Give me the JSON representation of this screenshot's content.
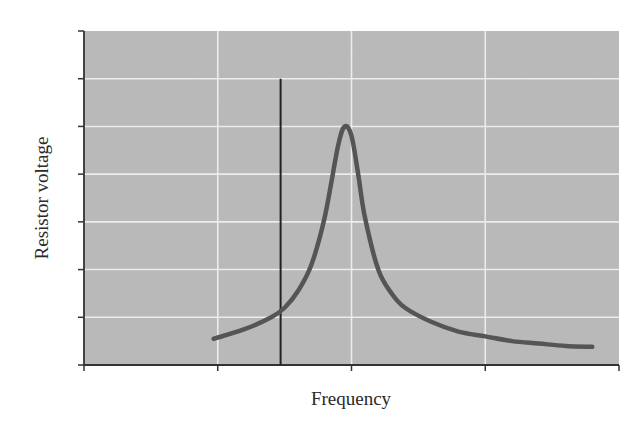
{
  "chart_data": {
    "type": "line",
    "title": "",
    "xlabel": "Frequency",
    "ylabel": "Resistor voltage",
    "x_ticks": [
      "",
      "",
      "",
      "",
      ""
    ],
    "y_ticks": [
      "",
      "",
      "",
      "",
      "",
      "",
      "",
      ""
    ],
    "grid": true,
    "legend": null,
    "xlim": [
      0,
      4
    ],
    "ylim": [
      0,
      7
    ],
    "series": [
      {
        "name": "Resistor voltage (resonance curve)",
        "x": [
          0.97,
          1.2,
          1.4,
          1.5,
          1.6,
          1.7,
          1.8,
          1.9,
          1.95,
          2.0,
          2.05,
          2.1,
          2.2,
          2.3,
          2.4,
          2.6,
          2.8,
          3.0,
          3.2,
          3.4,
          3.6,
          3.8
        ],
        "values": [
          0.55,
          0.75,
          1.0,
          1.2,
          1.55,
          2.1,
          3.1,
          4.6,
          5.0,
          4.8,
          4.0,
          3.1,
          2.0,
          1.5,
          1.2,
          0.9,
          0.7,
          0.6,
          0.5,
          0.45,
          0.4,
          0.38
        ]
      }
    ],
    "annotations": [
      {
        "type": "vertical-line",
        "x": 1.47,
        "y_from": 0,
        "y_to": 6
      }
    ],
    "peak": {
      "x": 1.95,
      "y": 5.0
    }
  },
  "colors": {
    "plot_background": "#b9b9b9",
    "gridline": "#ececec",
    "curve": "#555555",
    "axis": "#333333",
    "marker_line": "#222222",
    "text": "#2a2a2a"
  }
}
